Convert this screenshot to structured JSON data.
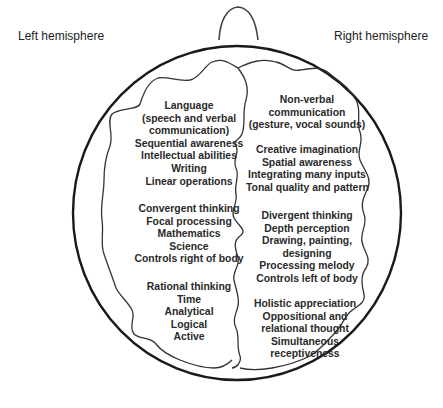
{
  "labels": {
    "left": "Left hemisphere",
    "right": "Right hemisphere"
  },
  "left_hemisphere": {
    "groups": [
      {
        "lines": [
          "Language",
          "(speech and verbal",
          "communication)",
          "Sequential awareness",
          "Intellectual abilities",
          "Writing",
          "Linear operations"
        ]
      },
      {
        "lines": [
          "Convergent thinking",
          "Focal processing",
          "Mathematics",
          "Science",
          "Controls right of body"
        ]
      },
      {
        "lines": [
          "Rational thinking",
          "Time",
          "Analytical",
          "Logical",
          "Active"
        ]
      }
    ]
  },
  "right_hemisphere": {
    "groups": [
      {
        "lines": [
          "Non-verbal",
          "communication",
          "(gesture, vocal sounds)"
        ]
      },
      {
        "lines": [
          "Creative imagination",
          "Spatial awareness",
          "Integrating many inputs",
          "Tonal quality and pattern"
        ]
      },
      {
        "lines": [
          "Divergent thinking",
          "Depth perception",
          "Drawing, painting,",
          "designing",
          "Processing melody",
          "Controls left of body"
        ]
      },
      {
        "lines": [
          "Holistic appreciation",
          "Oppositional and",
          "relational thought",
          "Simultaneous",
          "receptiveness"
        ]
      }
    ]
  },
  "colors": {
    "outline": "#1a1a1a",
    "text": "#2a2a2a",
    "background": "#ffffff"
  }
}
